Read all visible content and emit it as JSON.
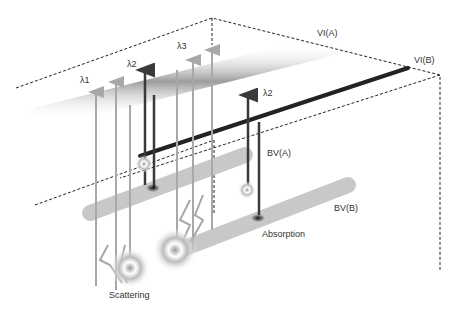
{
  "labels": {
    "vi_a": "VI(A)",
    "vi_b": "VI(B)",
    "lambda1": "λ1",
    "lambda2_left": "λ2",
    "lambda3": "λ3",
    "lambda2_right": "λ2",
    "bv_a": "BV(A)",
    "bv_b": "BV(B)",
    "absorption": "Absorption",
    "scattering": "Scattering"
  },
  "colors": {
    "light_ray": "#a8a8a8",
    "dark_ray": "#3a3a3a",
    "vessel": "#c8c8c8",
    "dashed": "#222222"
  }
}
